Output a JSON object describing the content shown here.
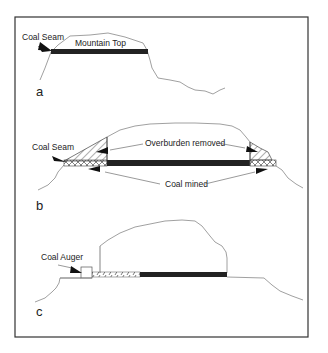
{
  "figure": {
    "frame": {
      "x": 15,
      "y": 17,
      "w": 293,
      "h": 320,
      "stroke": "#333333"
    },
    "colors": {
      "outline": "#777777",
      "seam": "#222222",
      "text": "#222222",
      "background": "#ffffff"
    },
    "panels": [
      {
        "id": "a",
        "panel_label": "a",
        "labels": {
          "coal_seam": "Coal Seam",
          "mountain_top": "Mountain Top"
        }
      },
      {
        "id": "b",
        "panel_label": "b",
        "labels": {
          "coal_seam": "Coal Seam",
          "overburden_removed": "Overburden removed",
          "coal_mined": "Coal mined"
        }
      },
      {
        "id": "c",
        "panel_label": "c",
        "labels": {
          "coal_auger": "Coal Auger"
        }
      }
    ]
  }
}
